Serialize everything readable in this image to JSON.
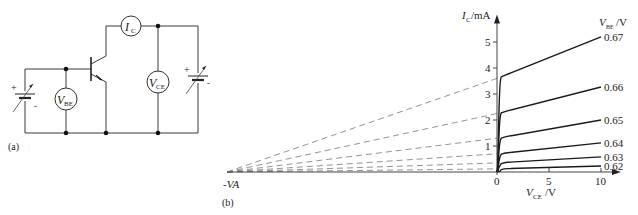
{
  "circuit": {
    "panel_label": "(a)",
    "meters": [
      {
        "id": "ic",
        "symbol": "I",
        "subscript": "C"
      },
      {
        "id": "vbe",
        "symbol": "V",
        "subscript": "BE"
      },
      {
        "id": "vce",
        "symbol": "V",
        "subscript": "CE"
      }
    ],
    "battery_plus": "+",
    "battery_minus": "-"
  },
  "chart_data": {
    "type": "line",
    "panel_label": "(b)",
    "title": "",
    "xlabel": {
      "symbol": "V",
      "subscript": "CE",
      "unit": "/V"
    },
    "ylabel": {
      "symbol": "I",
      "subscript": "C",
      "unit": "/mA"
    },
    "legend_title": {
      "symbol": "V",
      "subscript": "BE",
      "unit": "/V"
    },
    "xlim": [
      0,
      10
    ],
    "ylim": [
      0,
      5.6
    ],
    "xticks": [
      0,
      5,
      10
    ],
    "xtick_labels": [
      "0",
      "5",
      "10"
    ],
    "yticks": [
      1,
      2,
      3,
      4,
      5
    ],
    "ytick_labels": [
      "1",
      "2",
      "3",
      "4",
      "5"
    ],
    "early_voltage_label": "-VA",
    "grid": false,
    "series": [
      {
        "name": "0.62",
        "knee_current": 0.12,
        "end_current": 0.23
      },
      {
        "name": "0.63",
        "knee_current": 0.35,
        "end_current": 0.58
      },
      {
        "name": "0.64",
        "knee_current": 0.7,
        "end_current": 1.12
      },
      {
        "name": "0.65",
        "knee_current": 1.3,
        "end_current": 2.0
      },
      {
        "name": "0.66",
        "knee_current": 2.25,
        "end_current": 3.27
      },
      {
        "name": "0.67",
        "knee_current": 3.6,
        "end_current": 5.2
      }
    ],
    "series_note": "Each curve saturates at V_CE≈0.5 V then rises linearly to V_CE=10 V; dashed extensions extrapolate back to -VA on the V_CE axis."
  }
}
